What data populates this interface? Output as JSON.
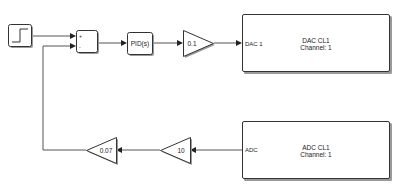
{
  "diagram": {
    "type": "simulink-block-diagram",
    "blocks": {
      "step": {
        "label": "",
        "icon": "step-function-icon"
      },
      "sum": {
        "label": "",
        "signs": [
          "+",
          "-"
        ]
      },
      "pid": {
        "label": "PID(s)"
      },
      "gain_forward": {
        "label": "0.1"
      },
      "dac": {
        "port_label": "DAC 1",
        "title": "DAC CL1",
        "subtitle": "Channel: 1"
      },
      "adc": {
        "port_label": "ADC",
        "title": "ADC CL1",
        "subtitle": "Channel: 1"
      },
      "gain_feedback_1": {
        "label": "10"
      },
      "gain_feedback_2": {
        "label": "0.07"
      }
    },
    "connections": [
      {
        "from": "step",
        "to": "sum.in1"
      },
      {
        "from": "sum",
        "to": "pid"
      },
      {
        "from": "pid",
        "to": "gain_forward"
      },
      {
        "from": "gain_forward",
        "to": "dac"
      },
      {
        "from": "adc",
        "to": "gain_feedback_1"
      },
      {
        "from": "gain_feedback_1",
        "to": "gain_feedback_2"
      },
      {
        "from": "gain_feedback_2",
        "to": "sum.in2"
      }
    ],
    "colors": {
      "block_border": "#333333",
      "line": "#555555",
      "background": "#ffffff"
    }
  }
}
